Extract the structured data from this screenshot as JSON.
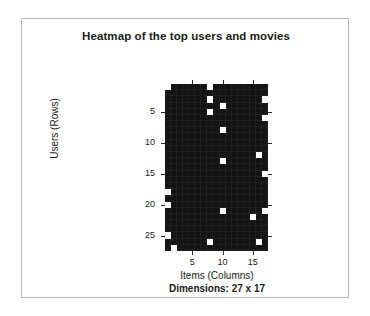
{
  "figure": {
    "title": "Heatmap of the top users and movies",
    "xlabel": "Items (Columns)",
    "ylabel": "Users (Rows)",
    "dimensions_caption": "Dimensions: 27 x 17",
    "background_color": "#ffffff",
    "frame_color": "#b9b9b9",
    "cell_off_color": "#141414",
    "cell_on_color": "#ffffff"
  },
  "chart_data": {
    "type": "heatmap",
    "title": "Heatmap of the top users and movies",
    "xlabel": "Items (Columns)",
    "ylabel": "Users (Rows)",
    "annotation": "Dimensions: 27 x 17",
    "n_rows": 27,
    "n_cols": 17,
    "row_axis_name": "Users (Rows)",
    "col_axis_name": "Items (Columns)",
    "xlim": [
      1,
      17
    ],
    "ylim": [
      1,
      27
    ],
    "x_ticks": [
      5,
      10,
      15
    ],
    "y_ticks": [
      5,
      10,
      15,
      20,
      25
    ],
    "grid": false,
    "legend": "none",
    "colorscale": [
      "#141414",
      "#ffffff"
    ],
    "value_range": [
      0,
      1
    ],
    "on_cells": [
      [
        1,
        1
      ],
      [
        1,
        8
      ],
      [
        3,
        8
      ],
      [
        3,
        17
      ],
      [
        4,
        10
      ],
      [
        5,
        8
      ],
      [
        6,
        17
      ],
      [
        8,
        10
      ],
      [
        12,
        16
      ],
      [
        13,
        10
      ],
      [
        15,
        17
      ],
      [
        18,
        1
      ],
      [
        20,
        1
      ],
      [
        21,
        10
      ],
      [
        21,
        17
      ],
      [
        22,
        15
      ],
      [
        25,
        1
      ],
      [
        26,
        8
      ],
      [
        26,
        16
      ],
      [
        27,
        2
      ]
    ],
    "values": [
      [
        1,
        0,
        0,
        0,
        0,
        0,
        0,
        1,
        0,
        0,
        0,
        0,
        0,
        0,
        0,
        0,
        0
      ],
      [
        0,
        0,
        0,
        0,
        0,
        0,
        0,
        0,
        0,
        0,
        0,
        0,
        0,
        0,
        0,
        0,
        0
      ],
      [
        0,
        0,
        0,
        0,
        0,
        0,
        0,
        1,
        0,
        0,
        0,
        0,
        0,
        0,
        0,
        0,
        1
      ],
      [
        0,
        0,
        0,
        0,
        0,
        0,
        0,
        0,
        0,
        1,
        0,
        0,
        0,
        0,
        0,
        0,
        0
      ],
      [
        0,
        0,
        0,
        0,
        0,
        0,
        0,
        1,
        0,
        0,
        0,
        0,
        0,
        0,
        0,
        0,
        0
      ],
      [
        0,
        0,
        0,
        0,
        0,
        0,
        0,
        0,
        0,
        0,
        0,
        0,
        0,
        0,
        0,
        0,
        1
      ],
      [
        0,
        0,
        0,
        0,
        0,
        0,
        0,
        0,
        0,
        0,
        0,
        0,
        0,
        0,
        0,
        0,
        0
      ],
      [
        0,
        0,
        0,
        0,
        0,
        0,
        0,
        0,
        0,
        1,
        0,
        0,
        0,
        0,
        0,
        0,
        0
      ],
      [
        0,
        0,
        0,
        0,
        0,
        0,
        0,
        0,
        0,
        0,
        0,
        0,
        0,
        0,
        0,
        0,
        0
      ],
      [
        0,
        0,
        0,
        0,
        0,
        0,
        0,
        0,
        0,
        0,
        0,
        0,
        0,
        0,
        0,
        0,
        0
      ],
      [
        0,
        0,
        0,
        0,
        0,
        0,
        0,
        0,
        0,
        0,
        0,
        0,
        0,
        0,
        0,
        0,
        0
      ],
      [
        0,
        0,
        0,
        0,
        0,
        0,
        0,
        0,
        0,
        0,
        0,
        0,
        0,
        0,
        0,
        1,
        0
      ],
      [
        0,
        0,
        0,
        0,
        0,
        0,
        0,
        0,
        0,
        1,
        0,
        0,
        0,
        0,
        0,
        0,
        0
      ],
      [
        0,
        0,
        0,
        0,
        0,
        0,
        0,
        0,
        0,
        0,
        0,
        0,
        0,
        0,
        0,
        0,
        0
      ],
      [
        0,
        0,
        0,
        0,
        0,
        0,
        0,
        0,
        0,
        0,
        0,
        0,
        0,
        0,
        0,
        0,
        1
      ],
      [
        0,
        0,
        0,
        0,
        0,
        0,
        0,
        0,
        0,
        0,
        0,
        0,
        0,
        0,
        0,
        0,
        0
      ],
      [
        0,
        0,
        0,
        0,
        0,
        0,
        0,
        0,
        0,
        0,
        0,
        0,
        0,
        0,
        0,
        0,
        0
      ],
      [
        1,
        0,
        0,
        0,
        0,
        0,
        0,
        0,
        0,
        0,
        0,
        0,
        0,
        0,
        0,
        0,
        0
      ],
      [
        0,
        0,
        0,
        0,
        0,
        0,
        0,
        0,
        0,
        0,
        0,
        0,
        0,
        0,
        0,
        0,
        0
      ],
      [
        1,
        0,
        0,
        0,
        0,
        0,
        0,
        0,
        0,
        0,
        0,
        0,
        0,
        0,
        0,
        0,
        0
      ],
      [
        0,
        0,
        0,
        0,
        0,
        0,
        0,
        0,
        0,
        1,
        0,
        0,
        0,
        0,
        0,
        0,
        1
      ],
      [
        0,
        0,
        0,
        0,
        0,
        0,
        0,
        0,
        0,
        0,
        0,
        0,
        0,
        0,
        1,
        0,
        0
      ],
      [
        0,
        0,
        0,
        0,
        0,
        0,
        0,
        0,
        0,
        0,
        0,
        0,
        0,
        0,
        0,
        0,
        0
      ],
      [
        0,
        0,
        0,
        0,
        0,
        0,
        0,
        0,
        0,
        0,
        0,
        0,
        0,
        0,
        0,
        0,
        0
      ],
      [
        1,
        0,
        0,
        0,
        0,
        0,
        0,
        0,
        0,
        0,
        0,
        0,
        0,
        0,
        0,
        0,
        0
      ],
      [
        0,
        0,
        0,
        0,
        0,
        0,
        0,
        1,
        0,
        0,
        0,
        0,
        0,
        0,
        0,
        1,
        0
      ],
      [
        0,
        1,
        0,
        0,
        0,
        0,
        0,
        0,
        0,
        0,
        0,
        0,
        0,
        0,
        0,
        0,
        0
      ]
    ]
  },
  "axes": {
    "y_tick_labels": [
      "5",
      "10",
      "15",
      "20",
      "25"
    ],
    "x_tick_labels": [
      "5",
      "10",
      "15"
    ]
  }
}
